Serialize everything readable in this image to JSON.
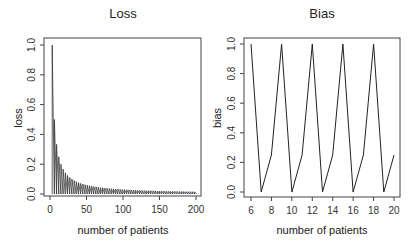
{
  "chart_data": [
    {
      "type": "line",
      "title": "Loss",
      "xlabel": "number of patients",
      "ylabel": "loss",
      "xlim": [
        0,
        200
      ],
      "ylim": [
        0,
        1.0
      ],
      "xticks": [
        "0",
        "50",
        "100",
        "150",
        "200"
      ],
      "yticks": [
        "0.0",
        "0.2",
        "0.4",
        "0.6",
        "0.8",
        "1.0"
      ],
      "grid": false,
      "legend": null,
      "description": "Rapidly oscillating series: each cycle spikes to a peak then drops to 0; peaks decay roughly as 3/n",
      "peaks": [
        {
          "x": 3,
          "y": 1.0
        },
        {
          "x": 6,
          "y": 0.5
        },
        {
          "x": 9,
          "y": 0.28
        },
        {
          "x": 12,
          "y": 0.2
        },
        {
          "x": 15,
          "y": 0.16
        },
        {
          "x": 20,
          "y": 0.12
        },
        {
          "x": 30,
          "y": 0.08
        },
        {
          "x": 50,
          "y": 0.05
        },
        {
          "x": 100,
          "y": 0.025
        },
        {
          "x": 150,
          "y": 0.018
        },
        {
          "x": 200,
          "y": 0.013
        }
      ],
      "trough": 0.0
    },
    {
      "type": "line",
      "title": "Bias",
      "xlabel": "number of patients",
      "ylabel": "bias",
      "xlim": [
        6,
        20
      ],
      "ylim": [
        0,
        1.0
      ],
      "xticks": [
        "6",
        "8",
        "10",
        "12",
        "14",
        "16",
        "18",
        "20"
      ],
      "yticks": [
        "0.0",
        "0.2",
        "0.4",
        "0.6",
        "0.8",
        "1.0"
      ],
      "grid": false,
      "legend": null,
      "x": [
        6,
        7,
        8,
        9,
        10,
        11,
        12,
        13,
        14,
        15,
        16,
        17,
        18,
        19,
        20
      ],
      "values": [
        1.0,
        0.0,
        0.25,
        1.0,
        0.0,
        0.25,
        1.0,
        0.0,
        0.25,
        1.0,
        0.0,
        0.25,
        1.0,
        0.0,
        0.25
      ]
    }
  ],
  "panels": {
    "loss": {
      "title": "Loss",
      "xlabel": "number of patients",
      "ylabel": "loss"
    },
    "bias": {
      "title": "Bias",
      "xlabel": "number of patients",
      "ylabel": "bias"
    }
  },
  "colors": {
    "line": "#222222",
    "axis": "#444444",
    "background": "#ffffff"
  }
}
